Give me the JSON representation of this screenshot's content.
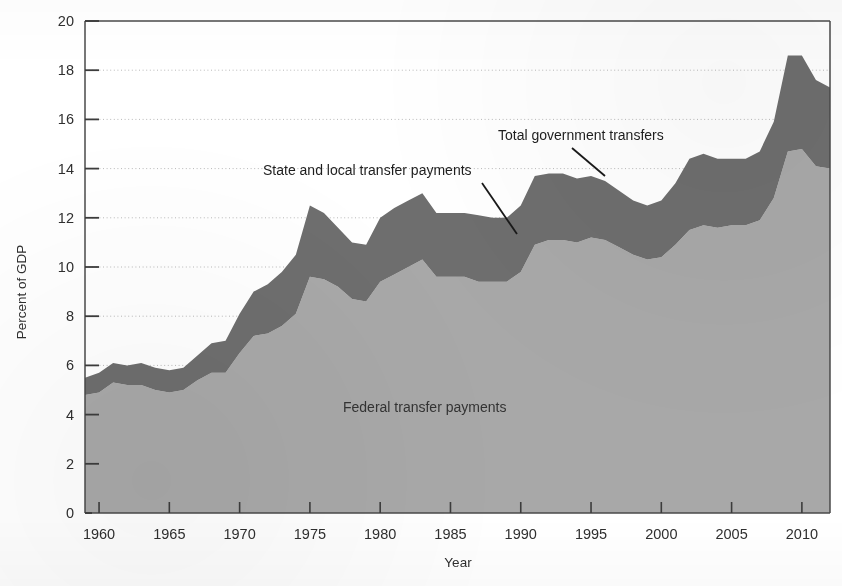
{
  "chart_data": {
    "type": "area",
    "title": "",
    "xlabel": "Year",
    "ylabel": "Percent of GDP",
    "xlim": [
      1959,
      2012
    ],
    "ylim": [
      0,
      20
    ],
    "xticks": [
      1960,
      1965,
      1970,
      1975,
      1980,
      1985,
      1990,
      1995,
      2000,
      2005,
      2010
    ],
    "yticks": [
      0,
      2,
      4,
      6,
      8,
      10,
      12,
      14,
      16,
      18,
      20
    ],
    "grid": "horizontal-dotted",
    "legend": "inline-annotations",
    "stacked": true,
    "x": [
      1959,
      1960,
      1961,
      1962,
      1963,
      1964,
      1965,
      1966,
      1967,
      1968,
      1969,
      1970,
      1971,
      1972,
      1973,
      1974,
      1975,
      1976,
      1977,
      1978,
      1979,
      1980,
      1981,
      1982,
      1983,
      1984,
      1985,
      1986,
      1987,
      1988,
      1989,
      1990,
      1991,
      1992,
      1993,
      1994,
      1995,
      1996,
      1997,
      1998,
      1999,
      2000,
      2001,
      2002,
      2003,
      2004,
      2005,
      2006,
      2007,
      2008,
      2009,
      2010,
      2011,
      2012
    ],
    "series": [
      {
        "name": "Federal transfer payments",
        "color": "#a8a8a8",
        "values": [
          4.8,
          4.9,
          5.3,
          5.2,
          5.2,
          5.0,
          4.9,
          5.0,
          5.4,
          5.7,
          5.7,
          6.5,
          7.2,
          7.3,
          7.6,
          8.1,
          9.6,
          9.5,
          9.2,
          8.7,
          8.6,
          9.4,
          9.7,
          10.0,
          10.3,
          9.6,
          9.6,
          9.6,
          9.4,
          9.4,
          9.4,
          9.8,
          10.9,
          11.1,
          11.1,
          11.0,
          11.2,
          11.1,
          10.8,
          10.5,
          10.3,
          10.4,
          10.9,
          11.5,
          11.7,
          11.6,
          11.7,
          11.7,
          11.9,
          12.8,
          14.7,
          14.8,
          14.1,
          14.0
        ]
      },
      {
        "name": "State and local transfer payments",
        "color": "#6e6e6e",
        "values": [
          0.7,
          0.8,
          0.8,
          0.8,
          0.9,
          0.9,
          0.9,
          0.9,
          1.0,
          1.2,
          1.3,
          1.6,
          1.8,
          2.0,
          2.2,
          2.4,
          2.9,
          2.7,
          2.4,
          2.3,
          2.3,
          2.6,
          2.7,
          2.7,
          2.7,
          2.6,
          2.6,
          2.6,
          2.7,
          2.6,
          2.6,
          2.7,
          2.8,
          2.7,
          2.7,
          2.6,
          2.5,
          2.4,
          2.3,
          2.2,
          2.2,
          2.3,
          2.5,
          2.9,
          2.9,
          2.8,
          2.7,
          2.7,
          2.8,
          3.1,
          3.9,
          3.8,
          3.5,
          3.3
        ]
      }
    ],
    "total_series": {
      "name": "Total government transfers",
      "values": [
        5.5,
        5.7,
        6.1,
        6.0,
        6.1,
        5.9,
        5.8,
        5.9,
        6.4,
        6.9,
        7.0,
        8.1,
        9.0,
        9.3,
        9.8,
        10.5,
        12.5,
        12.2,
        11.6,
        11.0,
        10.9,
        12.0,
        12.4,
        12.7,
        13.0,
        12.2,
        12.2,
        12.2,
        12.1,
        12.0,
        12.0,
        12.5,
        13.7,
        13.8,
        13.8,
        13.6,
        13.7,
        13.5,
        13.1,
        12.7,
        12.5,
        12.7,
        13.4,
        14.4,
        14.6,
        14.4,
        14.4,
        14.4,
        14.7,
        15.9,
        18.6,
        18.6,
        17.6,
        17.3
      ]
    },
    "annotations": [
      {
        "id": "total-government-transfers",
        "text": "Total government transfers"
      },
      {
        "id": "state-and-local-transfer-payments",
        "text": "State and local transfer payments"
      },
      {
        "id": "federal-transfer-payments",
        "text": "Federal transfer payments"
      }
    ]
  },
  "axes": {
    "y_title": "Percent of GDP",
    "x_title": "Year",
    "y_tick_labels": [
      "0",
      "2",
      "4",
      "6",
      "8",
      "10",
      "12",
      "14",
      "16",
      "18",
      "20"
    ],
    "x_tick_labels": [
      "1960",
      "1965",
      "1970",
      "1975",
      "1980",
      "1985",
      "1990",
      "1995",
      "2000",
      "2005",
      "2010"
    ]
  },
  "colors": {
    "federal_fill": "#a8a8a8",
    "state_local_fill": "#6e6e6e",
    "axis": "#4a4a4a",
    "grid": "#b9b9b9",
    "text": "#2f2f2f",
    "background": "#ffffff"
  }
}
